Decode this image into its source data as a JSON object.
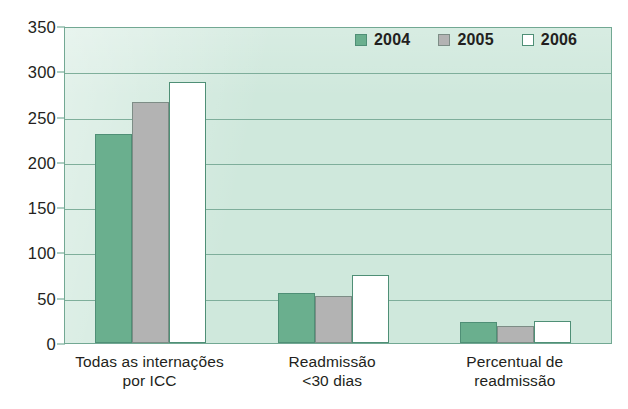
{
  "chart_data": {
    "type": "bar",
    "title": "",
    "subtitle": "",
    "xlabel": "",
    "ylabel": "",
    "ylim": [
      0,
      350
    ],
    "yticks": [
      0,
      50,
      100,
      150,
      200,
      250,
      300,
      350
    ],
    "ytick_labels": [
      "0",
      "50",
      "100",
      "150",
      "200",
      "250",
      "300",
      "350"
    ],
    "grid": true,
    "legend_position": "top-right",
    "categories": [
      "Todas as internações por ICC",
      "Readmissão <30 dias",
      "Percentual de readmissão"
    ],
    "category_lines": [
      [
        "Todas as internações",
        "por ICC"
      ],
      [
        "Readmissão",
        "<30 dias"
      ],
      [
        "Percentual de",
        "readmissão"
      ]
    ],
    "series": [
      {
        "name": "2004",
        "color": "#6aaf8e",
        "values": [
          231,
          55,
          23
        ]
      },
      {
        "name": "2005",
        "color": "#b3b3b3",
        "values": [
          266,
          52,
          19
        ]
      },
      {
        "name": "2006",
        "color": "#ffffff",
        "values": [
          288,
          75,
          24
        ]
      }
    ]
  },
  "legend": {
    "entries": [
      {
        "label": "2004",
        "swatch": "green-swatch-icon"
      },
      {
        "label": "2005",
        "swatch": "gray-swatch-icon"
      },
      {
        "label": "2006",
        "swatch": "white-swatch-icon"
      }
    ]
  },
  "colors": {
    "plot_background": "#cfe8dc",
    "gridline": "#79ab97",
    "axis": "#5f9e86",
    "bar_2004": "#6aaf8e",
    "bar_2005": "#b3b3b3",
    "bar_2006": "#ffffff",
    "bar_outline": "#4f8f76",
    "text": "#231f20"
  }
}
